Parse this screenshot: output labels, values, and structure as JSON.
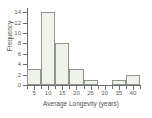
{
  "chart_data": {
    "type": "bar",
    "title": "",
    "xlabel": "Average Longevity (years)",
    "ylabel": "Frequency",
    "categories": [
      "5",
      "10",
      "15",
      "20",
      "25",
      "30",
      "35",
      "40"
    ],
    "values": [
      3,
      14,
      8,
      3,
      1,
      0,
      1,
      2
    ],
    "bin_width": 5,
    "bin_edges": [
      2.5,
      7.5,
      12.5,
      17.5,
      22.5,
      27.5,
      32.5,
      37.5,
      42.5
    ],
    "x_tick_labels": [
      "5",
      "10",
      "15",
      "20",
      "25",
      "30",
      "35",
      "40"
    ],
    "y_tick_labels": [
      "0",
      "2",
      "4",
      "6",
      "8",
      "10",
      "12",
      "14"
    ],
    "y_tick_values": [
      0,
      2,
      4,
      6,
      8,
      10,
      12,
      14
    ],
    "xlim": [
      2.5,
      42.5
    ],
    "ylim": [
      0,
      14.6
    ],
    "grid": false,
    "legend": null,
    "bar_fill_color": "#eef2e9",
    "bar_edge_color": "#8f968d",
    "axis_color": "#6e6e6e",
    "text_color": "#5d5d5d"
  }
}
